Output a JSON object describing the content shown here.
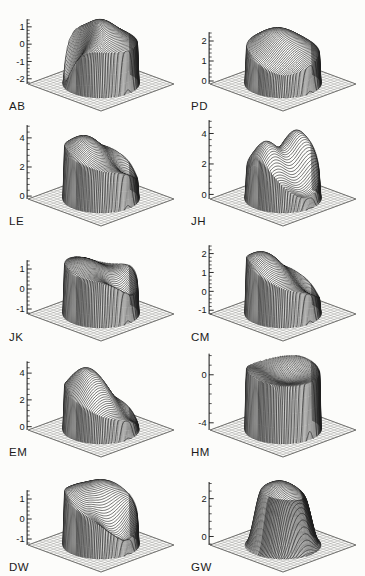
{
  "figure": {
    "background": "#fcfcfa",
    "ink": "#111111",
    "kind": "grid of 3D wireframe surface plots over circular disks on square base grids"
  },
  "chart_data": {
    "type": "3d-surface-mesh",
    "title": "",
    "layout": {
      "rows": 5,
      "cols": 2,
      "projection": "oblique isometric, z-axis with ticks at left of each panel",
      "grid": "sparse crosshatch base plane"
    },
    "panels": [
      {
        "label": "AB",
        "z_ticks": [
          1,
          0,
          -1,
          -2
        ],
        "z_minor_step": 0.2,
        "z_base": -2.3,
        "description": "high dome peaking near +1.5 with deep notch to about -2 at the back-left rim; steep cylindrical wall to base",
        "model": {
          "r0": 0.95,
          "a0": -0.2,
          "bumps": [
            [
              1.8,
              -0.15,
              0.15,
              1.3
            ],
            [
              -2.6,
              -0.75,
              0.5,
              3.0
            ]
          ]
        }
      },
      {
        "label": "PD",
        "z_ticks": [
          2,
          1,
          0
        ],
        "z_minor_step": 0.2,
        "z_base": -0.15,
        "description": "gentle dome, plateau ~1 at rim rising to ~2.5 near centre-back, slight sag front-left",
        "model": {
          "r0": 0.95,
          "a0": 1.0,
          "bumps": [
            [
              1.5,
              0.0,
              0.2,
              1.0
            ],
            [
              -0.5,
              -0.6,
              -0.6,
              2.0
            ]
          ]
        }
      },
      {
        "label": "LE",
        "z_ticks": [
          4,
          2,
          0
        ],
        "z_minor_step": 0.4,
        "z_base": -0.2,
        "description": "tall plateau ~2-4 with crest at back-left (~4) sloping to ~1 at front-right; tall wall to base",
        "model": {
          "r0": 0.95,
          "a0": 2.3,
          "bumps": [
            [
              1.8,
              -0.3,
              0.3,
              1.5
            ],
            [
              -1.3,
              0.6,
              -0.5,
              2.5
            ]
          ]
        }
      },
      {
        "label": "JH",
        "z_ticks": [
          4,
          2,
          0
        ],
        "z_minor_step": 0.4,
        "z_base": -0.3,
        "description": "two humps (~4) at left and right with saddle valley (~1) running front-to-back between them",
        "model": {
          "r0": 0.94,
          "a0": 1.1,
          "bumps": [
            [
              2.9,
              -0.55,
              0.05,
              2.6
            ],
            [
              2.9,
              0.55,
              0.05,
              2.6
            ],
            [
              -1.1,
              0.0,
              -0.6,
              2.0
            ],
            [
              -0.9,
              0.0,
              0.75,
              3.0
            ]
          ]
        }
      },
      {
        "label": "JK",
        "z_ticks": [
          1,
          0,
          -1
        ],
        "z_minor_step": 0.2,
        "z_base": -1.25,
        "description": "broad rippled plateau ~1-1.5 with shallow dip toward the front-right rim",
        "model": {
          "r0": 0.95,
          "a0": 1.0,
          "bumps": [
            [
              0.5,
              -0.3,
              0.3,
              2.0
            ],
            [
              -1.2,
              0.25,
              -0.65,
              3.0
            ],
            [
              -0.4,
              0.7,
              0.5,
              3.0
            ]
          ]
        }
      },
      {
        "label": "CM",
        "z_ticks": [
          2,
          1,
          0,
          -1
        ],
        "z_minor_step": 0.2,
        "z_base": -1.2,
        "description": "tilted dome, high (~2) at back-left sloping down to near base at front-right",
        "model": {
          "r0": 0.95,
          "a0": 0.4,
          "bumps": [
            [
              1.7,
              -0.45,
              0.35,
              1.2
            ],
            [
              -0.9,
              0.7,
              -0.5,
              2.0
            ]
          ]
        }
      },
      {
        "label": "EM",
        "z_ticks": [
          4,
          2,
          0
        ],
        "z_minor_step": 0.4,
        "z_base": -0.25,
        "description": "tall dome peaking ~4.4 at back-left, falling to ~0.3 at front-right rim",
        "model": {
          "r0": 0.95,
          "a0": 0.9,
          "bumps": [
            [
              3.5,
              -0.3,
              0.25,
              1.4
            ],
            [
              -0.9,
              0.7,
              -0.6,
              2.5
            ]
          ]
        }
      },
      {
        "label": "HM",
        "z_ticks": [
          0,
          -4
        ],
        "z_minor_step": 0.8,
        "z_base": -4.6,
        "description": "flat-topped cylinder near 0 with shallow central dip (~-0.5); very tall wall down to -4.6",
        "model": {
          "r0": 0.96,
          "a0": 0.3,
          "bumps": [
            [
              -0.9,
              0.0,
              0.0,
              1.8
            ],
            [
              0.5,
              -0.6,
              0.35,
              2.5
            ],
            [
              0.5,
              0.7,
              0.25,
              2.5
            ]
          ]
        }
      },
      {
        "label": "DW",
        "z_ticks": [
          1,
          0,
          -1
        ],
        "z_minor_step": 0.2,
        "z_base": -1.3,
        "description": "ridged plateau with two back bumps (~1.6) and a trough (~-0.7) along the front rim",
        "model": {
          "r0": 0.95,
          "a0": 0.7,
          "bumps": [
            [
              0.9,
              -0.45,
              0.4,
              2.0
            ],
            [
              0.7,
              0.5,
              0.35,
              2.5
            ],
            [
              -1.5,
              0.05,
              -0.7,
              2.2
            ]
          ]
        }
      },
      {
        "label": "GW",
        "z_ticks": [
          2,
          0
        ],
        "z_minor_step": 0.4,
        "z_base": -0.45,
        "description": "smooth round dome peaking ~2.8 at centre, tapering gently to the base with radial skirt",
        "model": {
          "r0": 0.55,
          "a0": 1.3,
          "bumps": [
            [
              1.6,
              0.0,
              0.05,
              1.1
            ],
            [
              -0.3,
              0.6,
              -0.5,
              2.0
            ]
          ]
        }
      }
    ]
  }
}
